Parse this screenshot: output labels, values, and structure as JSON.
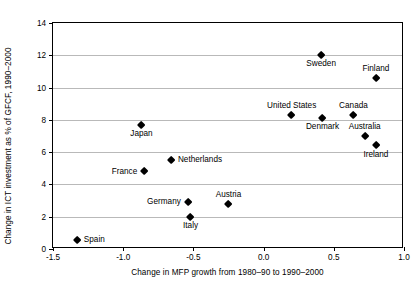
{
  "chart_data": {
    "type": "scatter",
    "title": "",
    "xlabel": "Change in MFP growth from 1980–90 to 1990–2000",
    "ylabel": "Change in ICT investment as % of GFCF, 1990–2000",
    "xlim": [
      -1.5,
      1.0
    ],
    "ylim": [
      0,
      14
    ],
    "xticks": [
      "-1.5",
      "-1.0",
      "-0.5",
      "0.0",
      "0.5",
      "1.0"
    ],
    "xtick_values": [
      -1.5,
      -1.0,
      -0.5,
      0.0,
      0.5,
      1.0
    ],
    "yticks": [
      "0",
      "2",
      "4",
      "6",
      "8",
      "10",
      "12",
      "14"
    ],
    "ytick_values": [
      0,
      2,
      4,
      6,
      8,
      10,
      12,
      14
    ],
    "grid": "horizontal",
    "legend": "none",
    "marker": "diamond",
    "marker_color": "#000000",
    "points": [
      {
        "label": "Sweden",
        "x": 0.41,
        "y": 12.0,
        "label_pos": "below"
      },
      {
        "label": "Finland",
        "x": 0.8,
        "y": 10.6,
        "label_pos": "above"
      },
      {
        "label": "United States",
        "x": 0.2,
        "y": 8.3,
        "label_pos": "above"
      },
      {
        "label": "Canada",
        "x": 0.64,
        "y": 8.3,
        "label_pos": "above"
      },
      {
        "label": "Denmark",
        "x": 0.42,
        "y": 8.1,
        "label_pos": "below"
      },
      {
        "label": "Australia",
        "x": 0.72,
        "y": 7.0,
        "label_pos": "above"
      },
      {
        "label": "Japan",
        "x": -0.87,
        "y": 7.7,
        "label_pos": "below"
      },
      {
        "label": "Ireland",
        "x": 0.8,
        "y": 6.4,
        "label_pos": "below"
      },
      {
        "label": "Netherlands",
        "x": -0.66,
        "y": 5.5,
        "label_pos": "right"
      },
      {
        "label": "France",
        "x": -0.85,
        "y": 4.8,
        "label_pos": "left"
      },
      {
        "label": "Germany",
        "x": -0.54,
        "y": 2.9,
        "label_pos": "left"
      },
      {
        "label": "Austria",
        "x": -0.25,
        "y": 2.8,
        "label_pos": "above"
      },
      {
        "label": "Italy",
        "x": -0.52,
        "y": 2.0,
        "label_pos": "below"
      },
      {
        "label": "Spain",
        "x": -1.33,
        "y": 0.55,
        "label_pos": "right"
      }
    ]
  }
}
